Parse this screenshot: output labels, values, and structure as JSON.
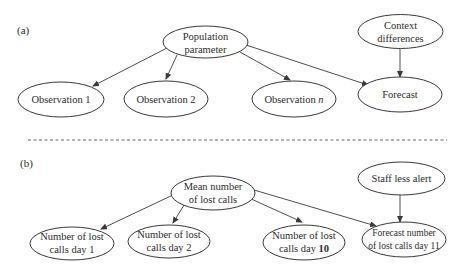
{
  "panels": [
    {
      "label": "(a)",
      "nodes": {
        "parent": {
          "lines": [
            "Population",
            "parameter"
          ]
        },
        "context": {
          "lines": [
            "Context",
            "differences"
          ]
        },
        "obs1": {
          "lines": [
            "Observation 1"
          ]
        },
        "obs2": {
          "lines": [
            "Observation 2"
          ]
        },
        "obsn": {
          "lines": [
            "Observation ",
            "n"
          ]
        },
        "forecast": {
          "lines": [
            "Forecast"
          ]
        }
      }
    },
    {
      "label": "(b)",
      "nodes": {
        "parent": {
          "lines": [
            "Mean number",
            "of lost calls"
          ]
        },
        "context": {
          "lines": [
            "Staff less alert"
          ]
        },
        "obs1": {
          "lines": [
            "Number of lost",
            "calls day 1"
          ]
        },
        "obs2": {
          "lines": [
            "Number of lost",
            "calls day 2"
          ]
        },
        "obsn": {
          "lines": [
            "Number of lost",
            "calls day ",
            "10"
          ]
        },
        "forecast": {
          "lines": [
            "Forecast number",
            "of lost calls day 11"
          ]
        }
      }
    }
  ],
  "colors": {
    "stroke": "#3a3a3a",
    "text": "#2b2b2b",
    "divider": "#555555"
  }
}
